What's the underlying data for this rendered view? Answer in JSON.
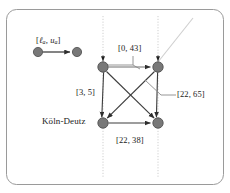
{
  "figure": {
    "name": "time-expanded-network-fragment",
    "frame": {
      "border_color": "#9a9a9a",
      "background": "#ffffff",
      "corner_radius": 10
    },
    "legend": {
      "name": "arc-interval-legend",
      "label": "[ℓₐ, uₐ]",
      "label_open_bracket": "[",
      "label_lower": "ℓ",
      "label_lower_sub": "a",
      "label_comma": ", ",
      "label_upper": "u",
      "label_upper_sub": "a",
      "label_close_bracket": "]",
      "from_node": "legend-node-left",
      "to_node": "legend-node-right"
    },
    "station_label": "Köln-Deutz",
    "labels": {
      "top": "[0, 43]",
      "left": "[3, 5]",
      "right": "[22, 65]",
      "bottom": "[22, 38]"
    },
    "colors": {
      "node_fill": "#787878",
      "node_stroke": "#4a4a4a",
      "edge": "#3c3c3c",
      "guide_line": "#cfcfcf",
      "leader_line": "#6f6f6f",
      "text": "#1a1a1a",
      "frame": "#9a9a9a"
    },
    "nodes": [
      {
        "name": "node-top-left",
        "x": 103,
        "y": 67,
        "r": 5.2
      },
      {
        "name": "node-top-right",
        "x": 158,
        "y": 67,
        "r": 5.2
      },
      {
        "name": "node-bottom-left",
        "x": 103,
        "y": 123,
        "r": 5.2
      },
      {
        "name": "node-bottom-right",
        "x": 158,
        "y": 123,
        "r": 5.2
      },
      {
        "name": "legend-node-left",
        "x": 38,
        "y": 52,
        "r": 4.6
      },
      {
        "name": "legend-node-right",
        "x": 77,
        "y": 52,
        "r": 4.6
      }
    ],
    "guide_lines": [
      {
        "name": "guide-line-left",
        "x": 103,
        "y1": 16,
        "y2": 178
      },
      {
        "name": "guide-line-right",
        "x": 158,
        "y1": 16,
        "y2": 178
      }
    ],
    "diagonal_guide": {
      "name": "diagonal-guide-line",
      "x1": 158,
      "y1": 62,
      "x2": 193,
      "y2": 18
    },
    "edges": [
      {
        "name": "edge-top-left-to-top-right",
        "from": "node-top-left",
        "to": "node-top-right"
      },
      {
        "name": "edge-bottom-left-to-bottom-right",
        "from": "node-bottom-left",
        "to": "node-bottom-right"
      },
      {
        "name": "edge-top-left-to-bottom-right",
        "from": "node-top-left",
        "to": "node-bottom-right"
      },
      {
        "name": "edge-top-right-to-bottom-left",
        "from": "node-top-right",
        "to": "node-bottom-left"
      },
      {
        "name": "edge-top-left-to-bottom-left",
        "from": "node-top-left",
        "to": "node-bottom-left"
      },
      {
        "name": "edge-top-right-to-bottom-right",
        "from": "node-top-right",
        "to": "node-bottom-right"
      }
    ]
  }
}
